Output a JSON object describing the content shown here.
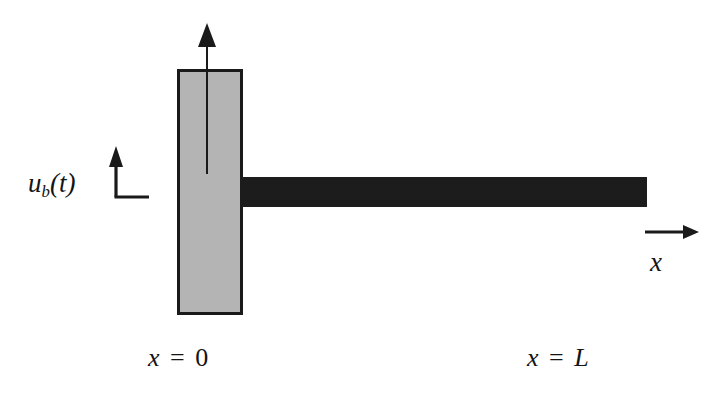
{
  "figure": {
    "background_color": "#ffffff"
  },
  "labels": {
    "base_displacement": {
      "full_text": "u_b(t)",
      "variable": "u",
      "subscript": "b",
      "argument": "(t)",
      "open_paren": "(",
      "time_var": "t",
      "close_paren": ")"
    },
    "axis_label": "x",
    "left_boundary": {
      "full_text": "x = 0",
      "variable": "x",
      "equals": "=",
      "value": "0"
    },
    "right_boundary": {
      "full_text": "x = L",
      "variable": "x",
      "equals": "=",
      "value": "L"
    }
  },
  "shapes": {
    "base_block": {
      "name": "base-block",
      "fill_color": "#b4b4b4",
      "stroke_color": "#1a1a1a",
      "x": 178,
      "y": 70,
      "width": 63,
      "height": 243
    },
    "beam": {
      "name": "beam",
      "fill_color": "#1d1d1d",
      "x": 240,
      "y": 177,
      "width": 407,
      "height": 30
    },
    "vertical_arrow": {
      "name": "base-motion-arrow",
      "color": "#1a1a1a",
      "tip_x": 207,
      "tip_y": 24,
      "tail_y": 174
    },
    "l_shaped_indicator": {
      "name": "displacement-indicator",
      "color": "#1a1a1a",
      "arrow_tip_x": 116,
      "arrow_tip_y": 148,
      "corner_x": 116,
      "corner_y": 197,
      "end_x": 148,
      "end_y": 197
    },
    "x_axis_arrow": {
      "name": "x-axis-arrow",
      "color": "#1a1a1a",
      "start_x": 645,
      "start_y": 232,
      "end_x": 697,
      "end_y": 232
    }
  },
  "colors": {
    "block_gray": "#b4b4b4",
    "beam_black": "#1d1d1d",
    "ink": "#1a1a1a",
    "paper": "#ffffff"
  }
}
